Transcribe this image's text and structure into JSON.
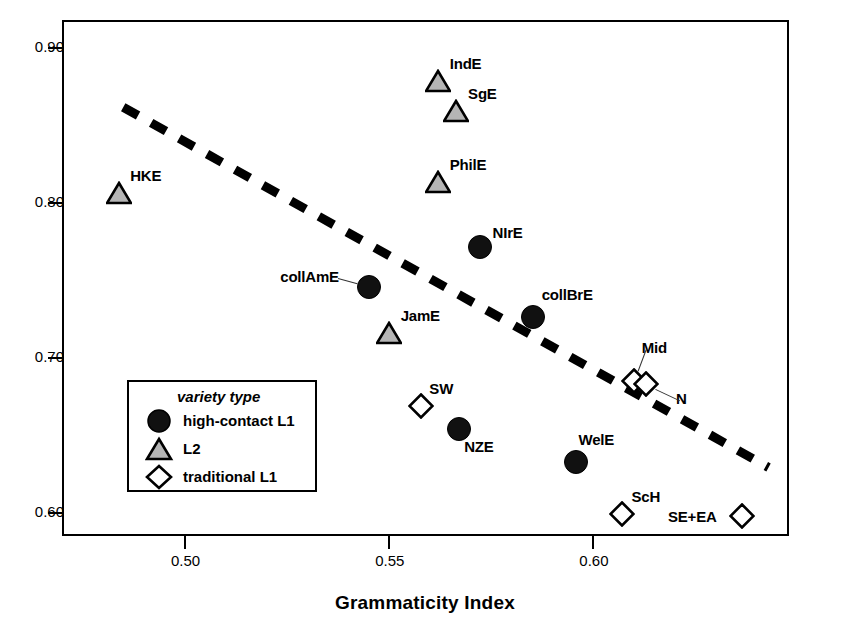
{
  "chart_data": {
    "type": "scatter",
    "title": "",
    "xlabel": "Grammaticity Index",
    "ylabel": "Transparency Index",
    "xlim": [
      0.47,
      0.648
    ],
    "ylim": [
      0.585,
      0.918
    ],
    "xticks": [
      0.5,
      0.55,
      0.6
    ],
    "xtick_labels": [
      "0.50",
      "0.55",
      "0.60"
    ],
    "yticks": [
      0.6,
      0.7,
      0.8,
      0.9
    ],
    "ytick_labels": [
      "0.60",
      "0.70",
      "0.80",
      "0.90"
    ],
    "grid": false,
    "legend_position": "inside-lower-left",
    "legend_title": "variety type",
    "series": [
      {
        "name": "high-contact L1",
        "marker": "circle",
        "points": [
          {
            "label": "NIrE",
            "x": 0.5715,
            "y": 0.7735,
            "label_dx": 14,
            "label_dy": -22,
            "leader": false
          },
          {
            "label": "collAmE",
            "x": 0.5445,
            "y": 0.7475,
            "label_dx": -88,
            "label_dy": -18,
            "leader": true
          },
          {
            "label": "collBrE",
            "x": 0.5845,
            "y": 0.728,
            "label_dx": 10,
            "label_dy": -30,
            "leader": false
          },
          {
            "label": "NZE",
            "x": 0.5665,
            "y": 0.656,
            "label_dx": 6,
            "label_dy": 10,
            "leader": false
          },
          {
            "label": "WelE",
            "x": 0.595,
            "y": 0.6345,
            "label_dx": 4,
            "label_dy": -30,
            "leader": false
          }
        ]
      },
      {
        "name": "L2",
        "marker": "triangle",
        "points": [
          {
            "label": "IndE",
            "x": 0.5615,
            "y": 0.88,
            "label_dx": 12,
            "label_dy": -26,
            "leader": false
          },
          {
            "label": "SgE",
            "x": 0.566,
            "y": 0.8605,
            "label_dx": 12,
            "label_dy": -26,
            "leader": false
          },
          {
            "label": "PhilE",
            "x": 0.5615,
            "y": 0.8145,
            "label_dx": 12,
            "label_dy": -26,
            "leader": false
          },
          {
            "label": "HKE",
            "x": 0.4835,
            "y": 0.8075,
            "label_dx": 11,
            "label_dy": -26,
            "leader": false
          },
          {
            "label": "JamE",
            "x": 0.5495,
            "y": 0.7175,
            "label_dx": 12,
            "label_dy": -26,
            "leader": false
          }
        ]
      },
      {
        "name": "traditional L1",
        "marker": "diamond",
        "points": [
          {
            "label": "Mid",
            "x": 0.6095,
            "y": 0.6865,
            "label_dx": 8,
            "label_dy": -42,
            "leader": true
          },
          {
            "label": "N",
            "x": 0.6125,
            "y": 0.6845,
            "label_dx": 30,
            "label_dy": 6,
            "leader": true
          },
          {
            "label": "SW",
            "x": 0.5575,
            "y": 0.67,
            "label_dx": 8,
            "label_dy": -26,
            "leader": false
          },
          {
            "label": "ScH",
            "x": 0.6065,
            "y": 0.6005,
            "label_dx": 10,
            "label_dy": -26,
            "leader": false
          },
          {
            "label": "SE+EA",
            "x": 0.636,
            "y": 0.5995,
            "label_dx": -74,
            "label_dy": -8,
            "leader": false
          }
        ]
      }
    ],
    "trend_line": {
      "style": "dashed",
      "x_start": 0.4845,
      "y_start": 0.863,
      "x_end": 0.6425,
      "y_end": 0.6305
    }
  },
  "legend": {
    "title": "variety type",
    "entries": [
      {
        "label": "high-contact L1",
        "marker": "circle"
      },
      {
        "label": "L2",
        "marker": "triangle"
      },
      {
        "label": "traditional L1",
        "marker": "diamond"
      }
    ]
  },
  "colors": {
    "axis": "#000000",
    "circle_fill": "#111111",
    "triangle_fill": "#b5b5b5",
    "diamond_fill": "#ffffff",
    "trend": "#000000",
    "background": "#ffffff"
  }
}
